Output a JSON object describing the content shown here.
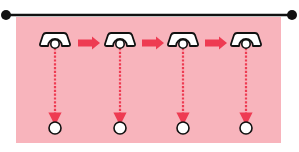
{
  "diagram": {
    "type": "trolley-track-sequence",
    "colors": {
      "background": "#ffffff",
      "panel": "#f8b4bc",
      "track": "#111111",
      "arrow": "#ee3b52",
      "dotted_line": "#ee3b52",
      "trolley_fill": "#ffffff",
      "trolley_stroke": "#111111",
      "target_fill": "#ffffff",
      "target_stroke": "#111111"
    },
    "track": {
      "x1": 6,
      "x2": 292,
      "y": 15,
      "end_dot_radius": 5
    },
    "panel": {
      "x": 16,
      "y": 17,
      "width": 265,
      "height": 126
    },
    "trolleys": [
      {
        "id": "trolley-1",
        "cx": 55,
        "cy": 40
      },
      {
        "id": "trolley-2",
        "cx": 120,
        "cy": 40
      },
      {
        "id": "trolley-3",
        "cx": 183,
        "cy": 40
      },
      {
        "id": "trolley-4",
        "cx": 246,
        "cy": 40
      }
    ],
    "arrows": [
      {
        "id": "arrow-1-2",
        "x1": 78,
        "x2": 100,
        "y": 43
      },
      {
        "id": "arrow-2-3",
        "x1": 142,
        "x2": 164,
        "y": 43
      },
      {
        "id": "arrow-3-4",
        "x1": 205,
        "x2": 227,
        "y": 43
      }
    ],
    "targets": [
      {
        "id": "target-1",
        "cx": 55,
        "cy": 128,
        "r": 6
      },
      {
        "id": "target-2",
        "cx": 120,
        "cy": 128,
        "r": 6
      },
      {
        "id": "target-3",
        "cx": 183,
        "cy": 128,
        "r": 6
      },
      {
        "id": "target-4",
        "cx": 246,
        "cy": 128,
        "r": 6
      }
    ]
  }
}
